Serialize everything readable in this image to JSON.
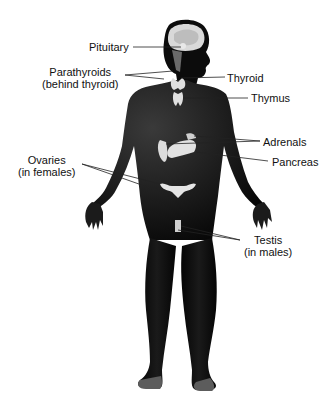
{
  "diagram": {
    "figure": "male-silhouette-front-view",
    "colors": {
      "background": "#ffffff",
      "body": "#0a0a0a",
      "glands": "#e6e6e6",
      "text": "#111111",
      "leader_lines": "#222222"
    },
    "labels": {
      "pituitary": {
        "line1": "Pituitary"
      },
      "parathyroids": {
        "line1": "Parathyroids",
        "line2": "(behind thyroid)"
      },
      "thyroid": {
        "line1": "Thyroid"
      },
      "thymus": {
        "line1": "Thymus"
      },
      "adrenals": {
        "line1": "Adrenals"
      },
      "pancreas": {
        "line1": "Pancreas"
      },
      "ovaries": {
        "line1": "Ovaries",
        "line2": "(in females)"
      },
      "testis": {
        "line1": "Testis",
        "line2": "(in males)"
      }
    }
  }
}
